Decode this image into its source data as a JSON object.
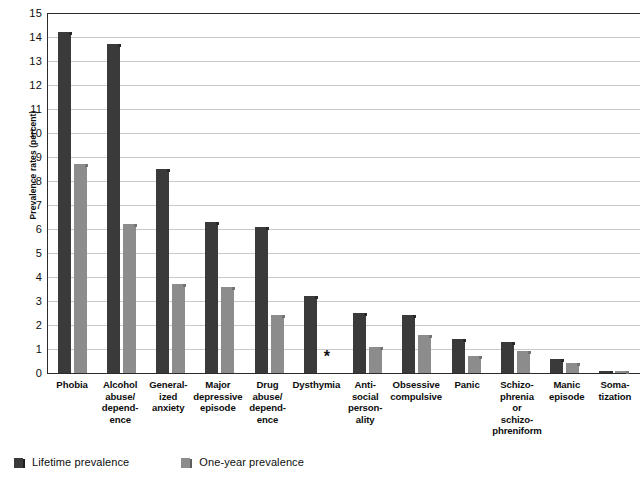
{
  "chart_data": {
    "type": "bar",
    "title": "",
    "xlabel": "",
    "ylabel": "Prevalence rates (percent)",
    "ylim": [
      0,
      15
    ],
    "ytick_step": 1,
    "yticks": [
      "15",
      "14",
      "13",
      "12",
      "11",
      "10",
      "9",
      "8",
      "7",
      "6",
      "5",
      "4",
      "3",
      "2",
      "1",
      "0"
    ],
    "grid": "horizontal",
    "legend_position": "bottom-left",
    "categories": [
      "Phobia",
      "Alcohol abuse/ depend- ence",
      "General- ized anxiety",
      "Major depressive episode",
      "Drug abuse/ depend- ence",
      "Dysthymia",
      "Anti- social person- ality",
      "Obsessive compulsive",
      "Panic",
      "Schizo- phrenia or schizo- phreniform",
      "Manic episode",
      "Soma- tization"
    ],
    "category_lines": [
      [
        "Phobia"
      ],
      [
        "Alcohol",
        "abuse/",
        "depend-",
        "ence"
      ],
      [
        "General-",
        "ized",
        "anxiety"
      ],
      [
        "Major",
        "depressive",
        "episode"
      ],
      [
        "Drug",
        "abuse/",
        "depend-",
        "ence"
      ],
      [
        "Dysthymia"
      ],
      [
        "Anti-",
        "social",
        "person-",
        "ality"
      ],
      [
        "Obsessive",
        "compulsive"
      ],
      [
        "Panic"
      ],
      [
        "Schizo-",
        "phrenia",
        "or",
        "schizo-",
        "phreniform"
      ],
      [
        "Manic",
        "episode"
      ],
      [
        "Soma-",
        "tization"
      ]
    ],
    "series": [
      {
        "name": "Lifetime prevalence",
        "color": "#3a3a3a",
        "values": [
          14.2,
          13.7,
          8.5,
          6.3,
          6.1,
          3.2,
          2.5,
          2.4,
          1.4,
          1.3,
          0.6,
          0.1
        ]
      },
      {
        "name": "One-year prevalence",
        "color": "#8c8c8c",
        "values": [
          8.7,
          6.2,
          3.7,
          3.6,
          2.4,
          null,
          1.1,
          1.6,
          0.7,
          0.9,
          0.4,
          0.1
        ]
      }
    ],
    "missing_marker": "*",
    "missing_note": "Dysthymia one-year prevalence marked with asterisk (not reported)"
  },
  "legend": {
    "items": [
      {
        "label": "Lifetime prevalence",
        "swatch": "lifetime"
      },
      {
        "label": "One-year prevalence",
        "swatch": "oneyear"
      }
    ]
  }
}
